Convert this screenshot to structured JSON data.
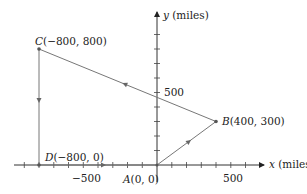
{
  "diagram": {
    "type": "coordinate-path",
    "x_axis": {
      "label_var": "x",
      "label_unit": " (miles)",
      "tick_labels": [
        {
          "value": -500,
          "text": "−500"
        },
        {
          "value": 500,
          "text": "500"
        }
      ],
      "tick_step": 100
    },
    "y_axis": {
      "label_var": "y",
      "label_unit": " (miles)",
      "tick_labels": [
        {
          "value": 500,
          "text": "500"
        }
      ],
      "tick_step": 100
    },
    "points": [
      {
        "id": "A",
        "name": "A",
        "coords": "(0, 0)",
        "x": 0,
        "y": 0
      },
      {
        "id": "B",
        "name": "B",
        "coords": "(400, 300)",
        "x": 400,
        "y": 300
      },
      {
        "id": "C",
        "name": "C",
        "coords": "(−800, 800)",
        "x": -800,
        "y": 800
      },
      {
        "id": "D",
        "name": "D",
        "coords": "(−800, 0)",
        "x": -800,
        "y": 0
      }
    ],
    "path_order": [
      "A",
      "B",
      "C",
      "D",
      "A"
    ],
    "colors": {
      "axis": "#333333",
      "path": "#777777",
      "text": "#222222"
    }
  }
}
